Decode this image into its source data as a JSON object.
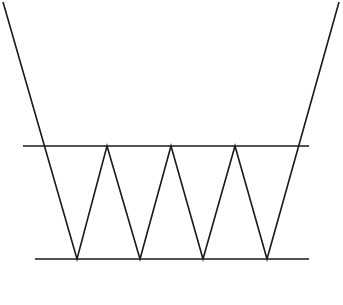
{
  "diagram": {
    "stroke_color": "#1a1a1a",
    "background": "#ffffff",
    "top_line": {
      "x1": 23,
      "y1": 146,
      "x2": 309,
      "y2": 146
    },
    "bottom_line": {
      "x1": 35,
      "y1": 259,
      "x2": 309,
      "y2": 259
    },
    "zigzag_points": [
      [
        3,
        2
      ],
      [
        77,
        259
      ],
      [
        107,
        146
      ],
      [
        140,
        259
      ],
      [
        171,
        146
      ],
      [
        203,
        259
      ],
      [
        235,
        146
      ],
      [
        267,
        259
      ],
      [
        339,
        2
      ]
    ]
  }
}
